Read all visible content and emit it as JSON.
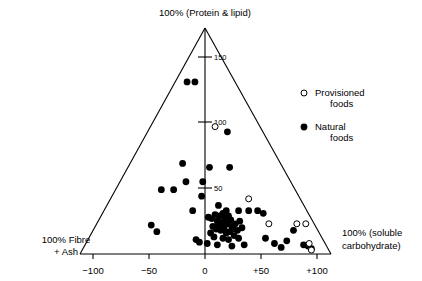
{
  "chart_data": {
    "type": "scatter",
    "title": "",
    "subtitle": "",
    "apex_label": "100% (Protein & lipid)",
    "left_corner_label_line1": "100%  Fibre",
    "left_corner_label_line2": "+ Ash",
    "right_corner_label_line1": "100% (soluble",
    "right_corner_label_line2": "carbohydrate)",
    "xlabel": "",
    "ylabel": "",
    "xlim": [
      -100,
      100
    ],
    "ylim": [
      0,
      175
    ],
    "grid": false,
    "legend_position": "right",
    "x_ticks": [
      {
        "value": -100,
        "label": "−100"
      },
      {
        "value": -50,
        "label": "−50"
      },
      {
        "value": 0,
        "label": "0"
      },
      {
        "value": 50,
        "label": "+50"
      },
      {
        "value": 100,
        "label": "+100"
      }
    ],
    "y_ticks": [
      {
        "value": 150,
        "label": "150"
      },
      {
        "value": 100,
        "label": "100"
      },
      {
        "value": 50,
        "label": "50"
      }
    ],
    "legend": [
      {
        "name": "Provisioned foods",
        "line1": "Provisioned",
        "line2": "foods",
        "marker": "open-circle"
      },
      {
        "name": "Natural foods",
        "line1": "Natural",
        "line2": "foods",
        "marker": "filled-circle"
      }
    ],
    "series": [
      {
        "name": "Natural foods",
        "marker": "filled-circle",
        "color": "#000000",
        "points": [
          [
            -16,
            131
          ],
          [
            -9,
            131
          ],
          [
            20,
            93
          ],
          [
            -20,
            69
          ],
          [
            4,
            66
          ],
          [
            22,
            66
          ],
          [
            -17,
            55
          ],
          [
            -2,
            55
          ],
          [
            -39,
            49
          ],
          [
            -28,
            49
          ],
          [
            -3,
            44
          ],
          [
            12,
            37
          ],
          [
            -11,
            33
          ],
          [
            19,
            33
          ],
          [
            30,
            33
          ],
          [
            39,
            33
          ],
          [
            47,
            33
          ],
          [
            52,
            31
          ],
          [
            -48,
            22
          ],
          [
            -43,
            17
          ],
          [
            3,
            28
          ],
          [
            6,
            27
          ],
          [
            9,
            30
          ],
          [
            11,
            25
          ],
          [
            13,
            29
          ],
          [
            15,
            24
          ],
          [
            16,
            31
          ],
          [
            18,
            27
          ],
          [
            20,
            23
          ],
          [
            21,
            29
          ],
          [
            23,
            26
          ],
          [
            24,
            21
          ],
          [
            7,
            21
          ],
          [
            10,
            19
          ],
          [
            12,
            22
          ],
          [
            14,
            18
          ],
          [
            17,
            20
          ],
          [
            19,
            16
          ],
          [
            22,
            17
          ],
          [
            25,
            19
          ],
          [
            27,
            23
          ],
          [
            29,
            18
          ],
          [
            31,
            25
          ],
          [
            33,
            20
          ],
          [
            5,
            16
          ],
          [
            8,
            13
          ],
          [
            16,
            12
          ],
          [
            21,
            11
          ],
          [
            26,
            14
          ],
          [
            30,
            12
          ],
          [
            -8,
            11
          ],
          [
            -5,
            9
          ],
          [
            2,
            8
          ],
          [
            11,
            7
          ],
          [
            24,
            6
          ],
          [
            35,
            7
          ],
          [
            54,
            12
          ],
          [
            62,
            8
          ],
          [
            68,
            5
          ],
          [
            73,
            10
          ],
          [
            79,
            18
          ],
          [
            88,
            7
          ],
          [
            92,
            6
          ],
          [
            95,
            4
          ]
        ]
      },
      {
        "name": "Provisioned foods",
        "marker": "open-circle",
        "color": "#ffffff",
        "points": [
          [
            9,
            97
          ],
          [
            39,
            42
          ],
          [
            57,
            23
          ],
          [
            82,
            23
          ],
          [
            90,
            23
          ],
          [
            93,
            8
          ],
          [
            95,
            3
          ]
        ]
      }
    ]
  }
}
